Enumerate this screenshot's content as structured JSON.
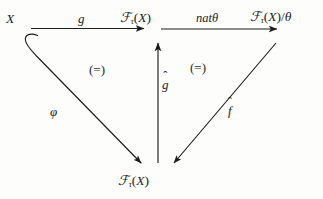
{
  "diagram": {
    "kind": "commutative-diagram",
    "background_color": "#fdfdfc",
    "ink_color": "#1c1c1c",
    "nodes": [
      {
        "id": "x",
        "label": "X",
        "position": "top-left"
      },
      {
        "id": "ftx_top",
        "label": "Fτ(X)",
        "position": "top-middle"
      },
      {
        "id": "ftx_theta",
        "label": "Fτ(X)/θ",
        "position": "top-right"
      },
      {
        "id": "ftx_bottom",
        "label": "Fτ(X)",
        "position": "bottom-middle"
      }
    ],
    "edges": [
      {
        "id": "g",
        "label": "g",
        "from": "x",
        "to": "ftx_top",
        "style": "straight-horizontal",
        "direction": "right"
      },
      {
        "id": "nat_theta",
        "label": "natθ",
        "from": "ftx_top",
        "to": "ftx_theta",
        "style": "straight-horizontal",
        "direction": "right"
      },
      {
        "id": "ghat",
        "label": "ĝ",
        "from": "ftx_bottom",
        "to": "ftx_top",
        "style": "straight-vertical",
        "direction": "up"
      },
      {
        "id": "phi",
        "label": "φ",
        "from": "x",
        "to": "ftx_bottom",
        "style": "hooked-diagonal",
        "direction": "down-right"
      },
      {
        "id": "fhat",
        "label": "f̂",
        "from": "ftx_theta",
        "to": "ftx_bottom",
        "style": "straight-diagonal",
        "direction": "down-left"
      }
    ],
    "cells": [
      {
        "id": "left-cell",
        "label": "(=)"
      },
      {
        "id": "right-cell",
        "label": "(=)"
      }
    ],
    "glyphs": {
      "script_f": "ℱ",
      "tau": "τ",
      "theta": "θ",
      "phi": "φ",
      "hat": "ˆ",
      "paren_open": "(",
      "paren_close": ")",
      "slash": "/",
      "x": "X",
      "g": "g",
      "f": "f",
      "nat": "nat"
    }
  }
}
